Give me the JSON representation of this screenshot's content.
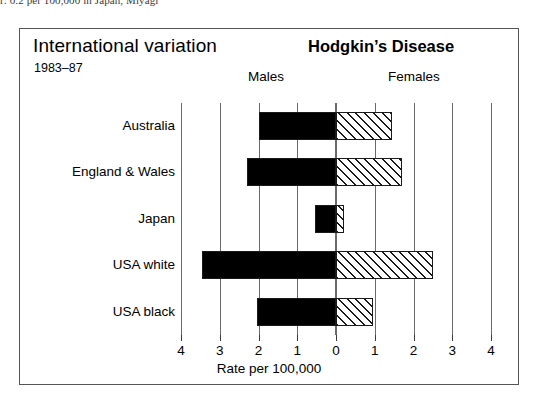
{
  "caption": {
    "text": "r: 0.2 per 100,000 in Japan, Miyagi"
  },
  "figure": {
    "title_left": "International variation",
    "subtitle": "1983–87",
    "title_right": "Hodgkin’s Disease",
    "panel_males": "Males",
    "panel_females": "Females",
    "x_axis_title": "Rate per 100,000"
  },
  "chart_data": {
    "type": "bar",
    "orientation": "horizontal",
    "style": "population-pyramid",
    "title": "Hodgkin’s Disease",
    "subtitle": "International variation 1983–87",
    "xlabel": "Rate per 100,000",
    "ylabel": "",
    "xlim": [
      -4,
      4
    ],
    "xticks": [
      -4,
      -3,
      -2,
      -1,
      0,
      1,
      2,
      3,
      4
    ],
    "xticklabels": [
      "4",
      "3",
      "2",
      "1",
      "0",
      "1",
      "2",
      "3",
      "4"
    ],
    "grid": true,
    "legend_position": "top-inside",
    "categories": [
      "Australia",
      "England & Wales",
      "Japan",
      "USA white",
      "USA black"
    ],
    "series": [
      {
        "name": "Males",
        "direction": "left",
        "fill": "solid-black",
        "color": "#000000",
        "values": [
          2.0,
          2.3,
          0.55,
          3.45,
          2.05
        ]
      },
      {
        "name": "Females",
        "direction": "right",
        "fill": "diagonal-hatch",
        "color": "#ffffff",
        "values": [
          1.45,
          1.7,
          0.2,
          2.5,
          0.95
        ]
      }
    ]
  }
}
